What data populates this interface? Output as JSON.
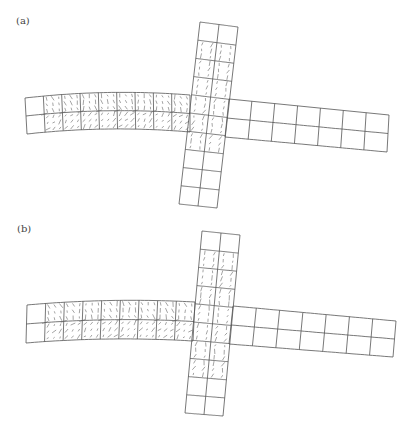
{
  "figure": {
    "width": 414,
    "height": 434,
    "colors": {
      "mesh": "#555555",
      "vectors": "#666666",
      "label": "#444444",
      "background": "#ffffff"
    },
    "panels": [
      {
        "label": "(a)",
        "label_pos": [
          16,
          24
        ],
        "members": [
          {
            "name": "left-beam",
            "corners": {
              "tl": [
                25,
                98
              ],
              "tr": [
                190,
                95
              ],
              "br": [
                190,
                132
              ],
              "bl": [
                27,
                134
              ]
            },
            "bend_mid_dy": -4,
            "nx": 9,
            "ny": 2,
            "vectors": true,
            "vector_cols": [
              1,
              9
            ]
          },
          {
            "name": "right-beam",
            "corners": {
              "tl": [
                229,
                99
              ],
              "tr": [
                389,
                115
              ],
              "br": [
                387,
                152
              ],
              "bl": [
                225,
                137
              ]
            },
            "bend_mid_dy": 0,
            "nx": 7,
            "ny": 2,
            "vectors": false
          },
          {
            "name": "vertical-column",
            "corners": {
              "tl": [
                200,
                22
              ],
              "tr": [
                238,
                27
              ],
              "br": [
                217,
                208
              ],
              "bl": [
                179,
                204
              ]
            },
            "bend_mid_dy": 0,
            "nx": 2,
            "ny": 10,
            "vectors": true,
            "vector_rows": [
              1,
              7
            ]
          }
        ]
      },
      {
        "label": "(b)",
        "label_pos": [
          17,
          232
        ],
        "members": [
          {
            "name": "left-beam",
            "corners": {
              "tl": [
                27,
                305
              ],
              "tr": [
                195,
                302
              ],
              "br": [
                193,
                341
              ],
              "bl": [
                26,
                343
              ]
            },
            "bend_mid_dy": -3,
            "nx": 9,
            "ny": 2,
            "vectors": true,
            "vector_cols": [
              1,
              9
            ]
          },
          {
            "name": "right-beam",
            "corners": {
              "tl": [
                233,
                306
              ],
              "tr": [
                396,
                321
              ],
              "br": [
                393,
                357
              ],
              "bl": [
                229,
                344
              ]
            },
            "bend_mid_dy": 0,
            "nx": 7,
            "ny": 2,
            "vectors": false
          },
          {
            "name": "vertical-column",
            "corners": {
              "tl": [
                202,
                231
              ],
              "tr": [
                240,
                235
              ],
              "br": [
                223,
                416
              ],
              "bl": [
                185,
                413
              ]
            },
            "bend_mid_dy": 0,
            "nx": 2,
            "ny": 10,
            "vectors": true,
            "vector_rows": [
              1,
              4,
              7,
              8
            ]
          }
        ]
      }
    ]
  }
}
